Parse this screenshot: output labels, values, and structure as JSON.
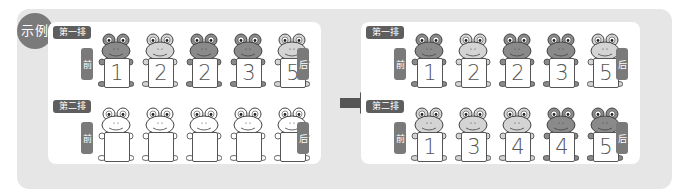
{
  "example_badge": "示例",
  "colors": {
    "frog_dark": "#8a8a8a",
    "frog_light": "#d4d4d4",
    "frog_blank": "#ffffff",
    "label_bg": "#5e5e5e",
    "side_bg": "#7a7a7a",
    "outer_bg": "#e6e6e6"
  },
  "front_label": "前",
  "back_label": "后",
  "before": {
    "rows": [
      {
        "label": "第一排",
        "frogs": [
          {
            "number": "1",
            "shade": "dark"
          },
          {
            "number": "2",
            "shade": "light"
          },
          {
            "number": "2",
            "shade": "dark"
          },
          {
            "number": "3",
            "shade": "dark"
          },
          {
            "number": "5",
            "shade": "light"
          }
        ]
      },
      {
        "label": "第二排",
        "frogs": [
          {
            "number": "",
            "shade": "blank"
          },
          {
            "number": "",
            "shade": "blank"
          },
          {
            "number": "",
            "shade": "blank"
          },
          {
            "number": "",
            "shade": "blank"
          },
          {
            "number": "",
            "shade": "blank"
          }
        ]
      }
    ]
  },
  "after": {
    "rows": [
      {
        "label": "第一排",
        "frogs": [
          {
            "number": "1",
            "shade": "dark"
          },
          {
            "number": "2",
            "shade": "light"
          },
          {
            "number": "2",
            "shade": "dark"
          },
          {
            "number": "3",
            "shade": "dark"
          },
          {
            "number": "5",
            "shade": "light"
          }
        ]
      },
      {
        "label": "第二排",
        "frogs": [
          {
            "number": "1",
            "shade": "light"
          },
          {
            "number": "3",
            "shade": "light"
          },
          {
            "number": "4",
            "shade": "light"
          },
          {
            "number": "4",
            "shade": "dark"
          },
          {
            "number": "5",
            "shade": "dark"
          }
        ]
      }
    ]
  }
}
